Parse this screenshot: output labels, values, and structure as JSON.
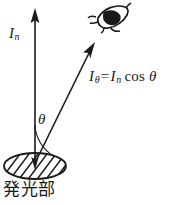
{
  "figure": {
    "background_color": "#ffffff",
    "ink_color": "#1a1a1a",
    "width": 188,
    "height": 205,
    "labels": {
      "normal_intensity": "I",
      "normal_intensity_sub": "n",
      "angle": "θ",
      "source_caption": "発光部",
      "formula": {
        "lhs_symbol": "I",
        "lhs_sub": "θ",
        "equals": "=",
        "rhs_symbol": "I",
        "rhs_sub": "n",
        "function": "cos",
        "angle": "θ",
        "full_text": "Iθ = In cos θ"
      }
    },
    "elements": {
      "normal_arrow_name": "normal-intensity-arrow",
      "angled_arrow_name": "angled-intensity-arrow",
      "angle_arc_name": "theta-angle-arc",
      "source_ellipse_name": "light-source-ellipse",
      "eye_icon_name": "observer-eye-icon",
      "down_arrow_name": "source-down-arrow"
    },
    "geometry": {
      "origin_x": 35,
      "origin_y": 163,
      "normal_tip_x": 35,
      "normal_tip_y": 9,
      "angled_tip_x": 95,
      "angled_tip_y": 45,
      "ellipse_cx": 35,
      "ellipse_cy": 166,
      "ellipse_rx": 31,
      "ellipse_ry": 13
    }
  }
}
